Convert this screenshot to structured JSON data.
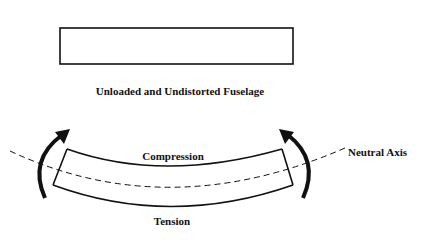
{
  "diagram": {
    "top_caption": "Unloaded and Undistorted Fuselage",
    "labels": {
      "compression": "Compression",
      "tension": "Tension",
      "neutral_axis": "Neutral Axis"
    },
    "colors": {
      "stroke": "#111111",
      "background": "#ffffff"
    }
  }
}
